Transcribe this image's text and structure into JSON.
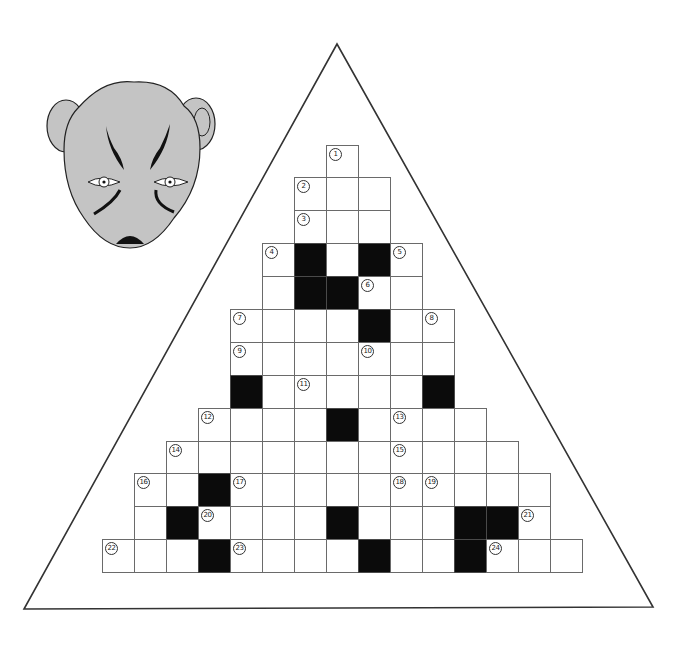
{
  "puzzle": {
    "type": "crossword",
    "shape": "triangle",
    "colors": {
      "background": "#ffffff",
      "outline": "#333333",
      "black_cell": "#0b0b0b",
      "grid_line": "#6a6a6a",
      "mask_fill": "#c4c4c4",
      "mask_stroke": "#222222"
    },
    "grid": {
      "origin_x": 102,
      "cell_w": 32,
      "row_tops": [
        145,
        177,
        210,
        243,
        276,
        309,
        342,
        375,
        408,
        441,
        473,
        506,
        539
      ],
      "rows": [
        {
          "start": 7,
          "cells": [
            "1"
          ]
        },
        {
          "start": 6,
          "cells": [
            "2",
            "",
            ""
          ]
        },
        {
          "start": 6,
          "cells": [
            "3",
            "",
            ""
          ]
        },
        {
          "start": 5,
          "cells": [
            "4",
            "#",
            "",
            "#",
            "5"
          ]
        },
        {
          "start": 5,
          "cells": [
            "",
            "#",
            "#",
            "6",
            ""
          ]
        },
        {
          "start": 4,
          "cells": [
            "7",
            "",
            "",
            "",
            "#",
            "",
            "8"
          ]
        },
        {
          "start": 4,
          "cells": [
            "9",
            "",
            "",
            "",
            "10",
            "",
            ""
          ]
        },
        {
          "start": 4,
          "cells": [
            "#",
            "",
            "11",
            "",
            "",
            "",
            "#"
          ]
        },
        {
          "start": 3,
          "cells": [
            "12",
            "",
            "",
            "",
            "#",
            "",
            "13",
            "",
            ""
          ]
        },
        {
          "start": 2,
          "cells": [
            "14",
            "",
            "",
            "",
            "",
            "",
            "",
            "15",
            "",
            "",
            ""
          ]
        },
        {
          "start": 1,
          "cells": [
            "16",
            "",
            "#",
            "17",
            "",
            "",
            "",
            "",
            "18",
            "19",
            "",
            "",
            ""
          ]
        },
        {
          "start": 1,
          "cells": [
            "",
            "#",
            "20",
            "",
            "",
            "",
            "#",
            "",
            "",
            "",
            "#",
            "#",
            "21"
          ]
        },
        {
          "start": 0,
          "cells": [
            "22",
            "",
            "",
            "#",
            "23",
            "",
            "",
            "",
            "#",
            "",
            "",
            "#",
            "24",
            "",
            ""
          ]
        }
      ]
    },
    "clue_numbers": [
      "1",
      "2",
      "3",
      "4",
      "5",
      "6",
      "7",
      "8",
      "9",
      "10",
      "11",
      "12",
      "13",
      "14",
      "15",
      "16",
      "17",
      "18",
      "19",
      "20",
      "21",
      "22",
      "23",
      "24"
    ],
    "decoration": {
      "triangle": {
        "top": [
          337,
          44
        ],
        "bottom_left": [
          24,
          609
        ],
        "bottom_right": [
          653,
          607
        ]
      },
      "mask_icon": "opera-mask-face-icon"
    }
  }
}
